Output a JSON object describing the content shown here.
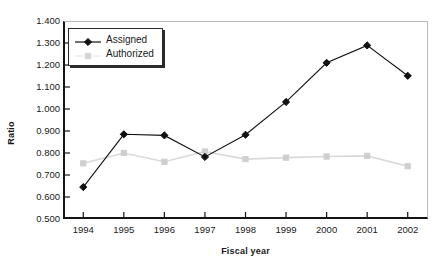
{
  "chart_data": {
    "type": "line",
    "title": "",
    "xlabel": "Fiscal year",
    "ylabel": "Ratio",
    "categories": [
      "1994",
      "1995",
      "1996",
      "1997",
      "1998",
      "1999",
      "2000",
      "2001",
      "2002"
    ],
    "x": [
      1994,
      1995,
      1996,
      1997,
      1998,
      1999,
      2000,
      2001,
      2002
    ],
    "series": [
      {
        "name": "Assigned",
        "color": "#111111",
        "marker": "diamond",
        "values": [
          0.645,
          0.885,
          0.88,
          0.782,
          0.883,
          1.032,
          1.21,
          1.289,
          1.151
        ]
      },
      {
        "name": "Authorized",
        "color": "#d9d9d9",
        "marker": "square",
        "values": [
          0.753,
          0.8,
          0.76,
          0.807,
          0.772,
          0.779,
          0.784,
          0.787,
          0.74
        ]
      }
    ],
    "ylim": [
      0.5,
      1.4
    ],
    "ytick_values": [
      0.5,
      0.6,
      0.7,
      0.8,
      0.9,
      1.0,
      1.1,
      1.2,
      1.3,
      1.4
    ],
    "ytick_labels": [
      "0.500",
      "0.600",
      "0.700",
      "0.800",
      "0.900",
      "1.000",
      "1.100",
      "1.200",
      "1.300",
      "1.400"
    ],
    "grid": false,
    "legend_position": "upper-left"
  }
}
